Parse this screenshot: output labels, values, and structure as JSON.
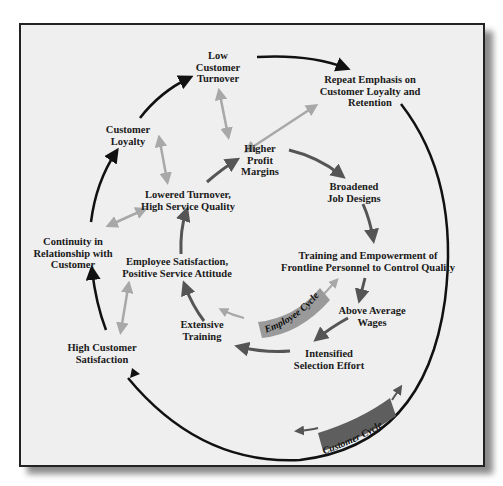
{
  "diagram": {
    "nodes": {
      "low_customer_turnover": "Low\nCustomer\nTurnover",
      "repeat_emphasis": "Repeat Emphasis on\nCustomer Loyalty and\nRetention",
      "customer_loyalty": "Customer\nLoyalty",
      "higher_profit_margins": "Higher\nProfit\nMargins",
      "lowered_turnover": "Lowered Turnover,\nHigh Service Quality",
      "broadened_job_designs": "Broadened\nJob Designs",
      "continuity": "Continuity in\nRelationship with\nCustomer",
      "employee_satisfaction": "Employee Satisfaction,\nPositive Service Attitude",
      "training_empowerment": "Training and Empowerment of\nFrontline Personnel to Control Quality",
      "above_average_wages": "Above Average\nWages",
      "extensive_training": "Extensive\nTraining",
      "high_customer_satisfaction": "High Customer\nSatisfaction",
      "intensified_selection": "Intensified\nSelection Effort"
    },
    "banners": {
      "employee_cycle": "Employee Cycle",
      "customer_cycle": "Customer Cycle"
    },
    "colors": {
      "frame_bg": "#efefef",
      "customer_arrow": "#111111",
      "employee_arrow": "#555555",
      "link_arrow": "#a8a8a8",
      "employee_banner": "#9a9a9a",
      "customer_banner": "#5e5e5e"
    }
  }
}
